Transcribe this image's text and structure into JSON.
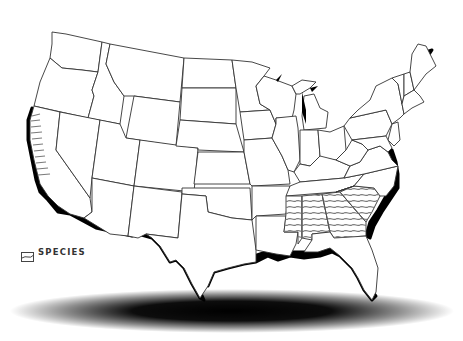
{
  "map": {
    "title": "United States species range map",
    "background_color": "#ffffff",
    "state_fill": "#ffffff",
    "state_stroke": "#333333",
    "coast_shadow_color": "#000000",
    "hatch_color": "#7a7a7a",
    "hatched_regions": [
      "Mississippi",
      "Alabama",
      "Georgia",
      "South Carolina",
      "California coast"
    ]
  },
  "legend": {
    "label": "SPECIES",
    "swatch": "hatch-icon"
  }
}
